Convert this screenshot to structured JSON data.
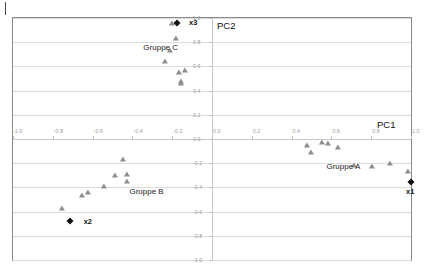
{
  "chart_data": {
    "type": "scatter",
    "title": "",
    "xlabel": "PC1",
    "ylabel": "PC2",
    "xlim": [
      -1.0,
      1.0
    ],
    "ylim": [
      -1.0,
      1.0
    ],
    "grid": true,
    "legend_position": "inline-annotations",
    "xticks": [
      "-1.0",
      "-0.8",
      "-0.6",
      "-0.4",
      "-0.2",
      "0.0",
      "0.2",
      "0.4",
      "0.6",
      "0.8",
      "1.0"
    ],
    "xtick_values": [
      -1.0,
      -0.8,
      -0.6,
      -0.4,
      -0.2,
      0.0,
      0.2,
      0.4,
      0.6,
      0.8,
      1.0
    ],
    "yticks": [
      "1.0",
      "0.8",
      "0.6",
      "0.4",
      "0.2",
      "0.0",
      "-0.2",
      "-0.4",
      "-0.6",
      "-0.8",
      "-1.0"
    ],
    "ytick_values": [
      1.0,
      0.8,
      0.6,
      0.4,
      0.2,
      0.0,
      -0.2,
      -0.4,
      -0.6,
      -0.8,
      -1.0
    ],
    "series": [
      {
        "name": "Gruppe C",
        "marker": "triangle",
        "color": "#8e8e8e",
        "points": [
          [
            -0.2,
            0.95
          ],
          [
            -0.18,
            0.83
          ],
          [
            -0.21,
            0.73
          ],
          [
            -0.235,
            0.635
          ],
          [
            -0.165,
            0.545
          ],
          [
            -0.135,
            0.565
          ],
          [
            -0.155,
            0.475
          ],
          [
            -0.155,
            0.455
          ]
        ]
      },
      {
        "name": "Gruppe B",
        "marker": "triangle",
        "color": "#8e8e8e",
        "points": [
          [
            -0.445,
            -0.175
          ],
          [
            -0.485,
            -0.305
          ],
          [
            -0.425,
            -0.3
          ],
          [
            -0.425,
            -0.355
          ],
          [
            -0.545,
            -0.395
          ],
          [
            -0.625,
            -0.445
          ],
          [
            -0.655,
            -0.475
          ],
          [
            -0.755,
            -0.575
          ]
        ]
      },
      {
        "name": "Gruppe A",
        "marker": "triangle",
        "color": "#8e8e8e",
        "points": [
          [
            0.475,
            -0.055
          ],
          [
            0.555,
            -0.035
          ],
          [
            0.585,
            -0.045
          ],
          [
            0.635,
            -0.075
          ],
          [
            0.495,
            -0.115
          ],
          [
            0.715,
            -0.225
          ],
          [
            0.805,
            -0.235
          ],
          [
            0.895,
            -0.21
          ],
          [
            0.985,
            -0.27
          ]
        ]
      },
      {
        "name": "Referenzpunkte",
        "marker": "diamond",
        "color": "#111111",
        "points": [
          [
            -0.175,
            0.955
          ],
          [
            -0.715,
            -0.675
          ],
          [
            1.0,
            -0.355
          ]
        ],
        "labels": [
          "x3",
          "x2",
          "x1"
        ]
      }
    ],
    "group_annotations": [
      {
        "text": "Gruppe C",
        "x": -0.345,
        "y": 0.755
      },
      {
        "text": "Gruppe B",
        "x": -0.415,
        "y": -0.435
      },
      {
        "text": "Gruppe A",
        "x": 0.575,
        "y": -0.235
      }
    ],
    "point_labels": [
      {
        "text": "x3",
        "x": -0.115,
        "y": 0.955
      },
      {
        "text": "x2",
        "x": -0.645,
        "y": -0.685
      },
      {
        "text": "x1",
        "x": 0.975,
        "y": -0.435
      }
    ]
  }
}
